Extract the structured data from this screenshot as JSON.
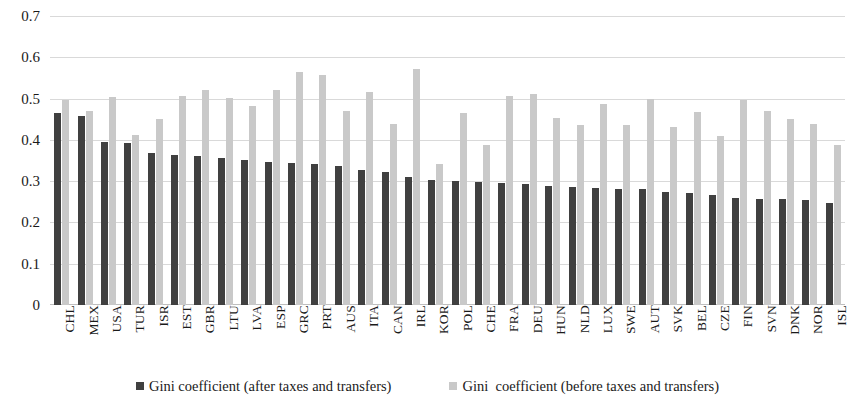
{
  "chart_data": {
    "type": "bar",
    "title": "",
    "xlabel": "",
    "ylabel": "",
    "ylim": [
      0,
      0.7
    ],
    "ytick_values": [
      0,
      0.1,
      0.2,
      0.3,
      0.4,
      0.5,
      0.6,
      0.7
    ],
    "ytick_labels": [
      "0",
      "0.1",
      "0.2",
      "0.3",
      "0.4",
      "0.5",
      "0.6",
      "0.7"
    ],
    "grid": true,
    "legend_position": "bottom",
    "colors": {
      "after_taxes": "#404040",
      "before_taxes": "#c9c9c9",
      "gridline": "#d9d9d9"
    },
    "categories": [
      "CHL",
      "MEX",
      "USA",
      "TUR",
      "ISR",
      "EST",
      "GBR",
      "LTU",
      "LVA",
      "ESP",
      "GRC",
      "PRT",
      "AUS",
      "ITA",
      "CAN",
      "IRL",
      "KOR",
      "POL",
      "CHE",
      "FRA",
      "DEU",
      "HUN",
      "NLD",
      "LUX",
      "SWE",
      "AUT",
      "SVK",
      "BEL",
      "CZE",
      "FIN",
      "SVN",
      "DNK",
      "NOR",
      "ISL"
    ],
    "series": [
      {
        "name": "Gini coefficient (after taxes and transfers)",
        "color": "#404040",
        "values": [
          0.465,
          0.459,
          0.394,
          0.393,
          0.367,
          0.363,
          0.36,
          0.357,
          0.352,
          0.346,
          0.343,
          0.342,
          0.337,
          0.328,
          0.322,
          0.309,
          0.304,
          0.3,
          0.297,
          0.295,
          0.293,
          0.288,
          0.285,
          0.284,
          0.282,
          0.28,
          0.273,
          0.271,
          0.266,
          0.26,
          0.257,
          0.256,
          0.254,
          0.248
        ]
      },
      {
        "name": "Gini  coefficient (before taxes and transfers)",
        "color": "#c9c9c9",
        "values": [
          0.497,
          0.471,
          0.505,
          0.413,
          0.451,
          0.506,
          0.52,
          0.502,
          0.482,
          0.522,
          0.565,
          0.557,
          0.47,
          0.515,
          0.438,
          0.572,
          0.341,
          0.466,
          0.388,
          0.507,
          0.511,
          0.453,
          0.437,
          0.486,
          0.435,
          0.498,
          0.43,
          0.467,
          0.409,
          0.496,
          0.47,
          0.45,
          0.438,
          0.388
        ]
      }
    ]
  },
  "legend": {
    "items": [
      {
        "label": "Gini coefficient (after taxes and transfers)",
        "swatch": "after"
      },
      {
        "label": "Gini  coefficient (before taxes and transfers)",
        "swatch": "before"
      }
    ]
  }
}
